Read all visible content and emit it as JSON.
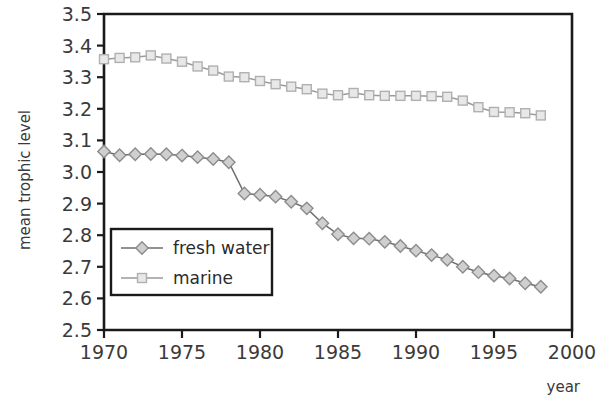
{
  "chart_data": {
    "type": "line",
    "title": "",
    "xlabel": "year",
    "ylabel": "mean trophic level",
    "xlim": [
      1970,
      2000
    ],
    "ylim": [
      2.5,
      3.5
    ],
    "xticks": [
      1970,
      1975,
      1980,
      1985,
      1990,
      1995,
      2000
    ],
    "xticklabels": [
      "1970",
      "1975",
      "1980",
      "1985",
      "1990",
      "1995",
      "2000"
    ],
    "yticks": [
      2.5,
      2.6,
      2.7,
      2.8,
      2.9,
      3.0,
      3.1,
      3.2,
      3.3,
      3.4,
      3.5
    ],
    "yticklabels": [
      "2.5",
      "2.6",
      "2.7",
      "2.8",
      "2.9",
      "3.0",
      "3.1",
      "3.2",
      "3.3",
      "3.4",
      "3.5"
    ],
    "grid": false,
    "legend_position": "lower-left-inside",
    "x": [
      1970,
      1971,
      1972,
      1973,
      1974,
      1975,
      1976,
      1977,
      1978,
      1979,
      1980,
      1981,
      1982,
      1983,
      1984,
      1985,
      1986,
      1987,
      1988,
      1989,
      1990,
      1991,
      1992,
      1993,
      1994,
      1995,
      1996,
      1997,
      1998
    ],
    "series": [
      {
        "name": "fresh water",
        "marker": "diamond",
        "color": "#8c8c8c",
        "line_color": "#6e6e6e",
        "values": [
          3.065,
          3.053,
          3.056,
          3.057,
          3.056,
          3.052,
          3.047,
          3.041,
          3.031,
          2.932,
          2.928,
          2.922,
          2.906,
          2.885,
          2.838,
          2.803,
          2.79,
          2.789,
          2.779,
          2.766,
          2.751,
          2.737,
          2.722,
          2.7,
          2.683,
          2.672,
          2.663,
          2.648,
          2.637
        ]
      },
      {
        "name": "marine",
        "marker": "square",
        "color": "#b0b0b0",
        "line_color": "#9a9a9a",
        "values": [
          3.357,
          3.361,
          3.363,
          3.369,
          3.359,
          3.349,
          3.334,
          3.321,
          3.302,
          3.3,
          3.288,
          3.278,
          3.27,
          3.262,
          3.248,
          3.243,
          3.25,
          3.243,
          3.241,
          3.241,
          3.241,
          3.24,
          3.238,
          3.226,
          3.205,
          3.19,
          3.189,
          3.186,
          3.179
        ]
      }
    ],
    "legend": [
      {
        "label": "fresh water",
        "marker": "diamond"
      },
      {
        "label": "marine",
        "marker": "square"
      }
    ]
  },
  "colors": {
    "axis": "#1a1a1a",
    "text": "#3a3a3a",
    "background": "#ffffff",
    "fresh_water": "#8c8c8c",
    "marine": "#b0b0b0"
  }
}
